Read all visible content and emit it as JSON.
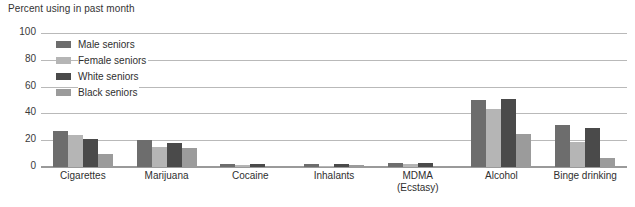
{
  "chart_data": {
    "type": "bar",
    "title": "Percent using in past month",
    "xlabel": "",
    "ylabel": "Percent using in past month",
    "ylim": [
      0,
      100
    ],
    "yticks": [
      0,
      20,
      40,
      60,
      80,
      100
    ],
    "grid": true,
    "legend_position": "inside-top-left",
    "categories": [
      "Cigarettes",
      "Marijuana",
      "Cocaine",
      "Inhalants",
      "MDMA (Ecstasy)",
      "Alcohol",
      "Binge drinking"
    ],
    "category_lines": [
      [
        "Cigarettes"
      ],
      [
        "Marijuana"
      ],
      [
        "Cocaine"
      ],
      [
        "Inhalants"
      ],
      [
        "MDMA",
        "(Ecstasy)"
      ],
      [
        "Alcohol"
      ],
      [
        "Binge drinking"
      ]
    ],
    "series": [
      {
        "name": "Male seniors",
        "color": "#6d6d6d",
        "values": [
          27,
          20,
          2.0,
          2.0,
          3.0,
          50,
          31
        ]
      },
      {
        "name": "Female seniors",
        "color": "#b5b5b5",
        "values": [
          24,
          15,
          1.5,
          1.0,
          2.0,
          43,
          19
        ]
      },
      {
        "name": "White seniors",
        "color": "#4a4a4a",
        "values": [
          21,
          18,
          2.0,
          2.0,
          3.0,
          51,
          29
        ]
      },
      {
        "name": "Black seniors",
        "color": "#9b9b9b",
        "values": [
          10,
          14,
          0.8,
          1.5,
          1.0,
          25,
          7
        ]
      }
    ]
  },
  "colors": {
    "background": "#ffffff",
    "gridline": "#b9b9b9",
    "axis": "#9a9a9a",
    "text": "#2f2f2f"
  }
}
